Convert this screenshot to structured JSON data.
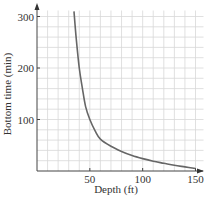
{
  "chart_data": {
    "type": "line",
    "title": "",
    "xlabel": "Depth (ft)",
    "ylabel": "Bottom time (min)",
    "xlim": [
      0,
      150
    ],
    "ylim": [
      0,
      300
    ],
    "x_ticks": [
      50,
      100,
      150
    ],
    "x_tick_labels": [
      "50",
      "100",
      "150"
    ],
    "y_ticks": [
      100,
      200,
      300
    ],
    "y_tick_labels": [
      "100",
      "200",
      "300"
    ],
    "x_grid_step": 10,
    "y_grid_step": 20,
    "grid": true,
    "legend": "none",
    "series": [
      {
        "name": "Bottom time",
        "x": [
          35,
          37,
          40,
          43,
          46,
          50,
          55,
          60,
          70,
          80,
          90,
          100,
          110,
          120,
          130,
          140,
          150
        ],
        "y": [
          310,
          260,
          200,
          160,
          125,
          100,
          78,
          62,
          48,
          38,
          30,
          24,
          19,
          15,
          11,
          8,
          5
        ]
      }
    ]
  }
}
